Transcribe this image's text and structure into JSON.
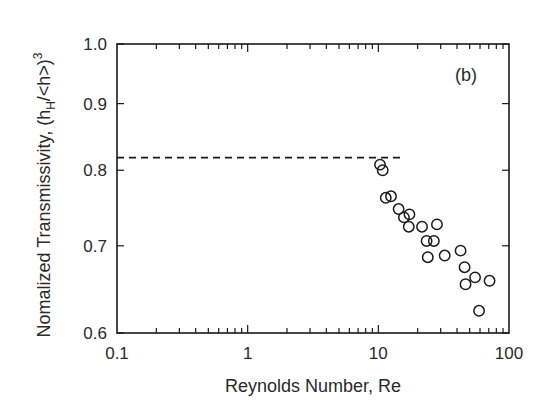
{
  "chart_data": {
    "type": "scatter",
    "title": "",
    "panel_label": "(b)",
    "xlabel": "Reynolds Number, Re",
    "ylabel": "Nomalized Transmissivity, (h",
    "ylabel_sub": "H",
    "ylabel_tail": "/<h>)",
    "ylabel_sup": "3",
    "xscale": "log",
    "yscale": "log",
    "xlim": [
      0.1,
      100
    ],
    "ylim": [
      0.6,
      1.0
    ],
    "xticks": [
      0.1,
      1,
      10,
      100
    ],
    "xtick_labels": [
      "0.1",
      "1",
      "10",
      "100"
    ],
    "yticks": [
      0.6,
      0.7,
      0.8,
      0.9,
      1.0
    ],
    "ytick_labels": [
      "0.6",
      "0.7",
      "0.8",
      "0.9",
      "1.0"
    ],
    "grid": false,
    "legend": null,
    "reference_line": {
      "style": "dashed",
      "y": 0.818,
      "x_range": [
        0.1,
        16
      ]
    },
    "series": [
      {
        "name": "data",
        "marker": "open-circle",
        "x": [
          10.3,
          10.8,
          11.4,
          12.5,
          14.3,
          15.7,
          17.3,
          17.1,
          21.6,
          28.1,
          23.4,
          26.6,
          23.9,
          32.2,
          42.6,
          45.7,
          46.5,
          55.0,
          59.0,
          71.0
        ],
        "y": [
          0.808,
          0.8,
          0.762,
          0.764,
          0.747,
          0.736,
          0.74,
          0.724,
          0.724,
          0.727,
          0.706,
          0.706,
          0.686,
          0.688,
          0.694,
          0.674,
          0.654,
          0.662,
          0.624,
          0.658
        ]
      }
    ]
  }
}
